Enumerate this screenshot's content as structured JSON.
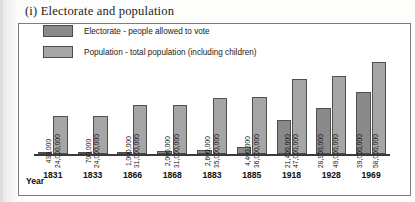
{
  "title": "(i) Electorate and population",
  "axis": {
    "year_label": "Year"
  },
  "legend": {
    "items": [
      {
        "label": "Electorate - people allowed to vote",
        "color": "#8a8a8a",
        "key": "electorate"
      },
      {
        "label": "Population - total population (including children)",
        "color": "#a6a6a6",
        "key": "population"
      }
    ]
  },
  "chart_data": {
    "type": "bar",
    "title": "(i) Electorate and population",
    "xlabel": "Year",
    "ylabel": "",
    "grid": false,
    "legend_position": "top-left",
    "categories": [
      "1831",
      "1833",
      "1866",
      "1868",
      "1883",
      "1885",
      "1918",
      "1928",
      "1969"
    ],
    "series": [
      {
        "name": "Electorate - people allowed to vote",
        "color": "#8a8a8a",
        "values": [
          435000,
          700000,
          1000000,
          2000000,
          2600000,
          4400000,
          21400000,
          28900000,
          39000000
        ],
        "labels": [
          "435,000",
          "700,000",
          "1,000,000",
          "2,000,000",
          "2,600,000",
          "4,400,000",
          "21,400,000",
          "28,900,000",
          "39,000,000"
        ]
      },
      {
        "name": "Population - total population (including children)",
        "color": "#a6a6a6",
        "values": [
          24000000,
          24000000,
          31000000,
          31000000,
          35000000,
          36000000,
          47000000,
          49000000,
          58000000
        ],
        "labels": [
          "24,000,000",
          "24,000,000",
          "31,000,000",
          "31,000,000",
          "35,000,000",
          "36,000,000",
          "47,000,000",
          "49,000,000",
          "58,000,000"
        ]
      }
    ],
    "ylim": [
      0,
      58000000
    ]
  }
}
